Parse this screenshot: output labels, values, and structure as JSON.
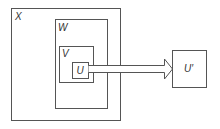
{
  "diagram": {
    "stroke_color": "#555555",
    "sets": [
      {
        "id": "X",
        "label": "X"
      },
      {
        "id": "W",
        "label": "W"
      },
      {
        "id": "V",
        "label": "V"
      },
      {
        "id": "U",
        "label": "U"
      },
      {
        "id": "U_prime",
        "label": "U′"
      }
    ],
    "arrow": {
      "from": "U",
      "to": "U′",
      "style": "double-line"
    }
  }
}
